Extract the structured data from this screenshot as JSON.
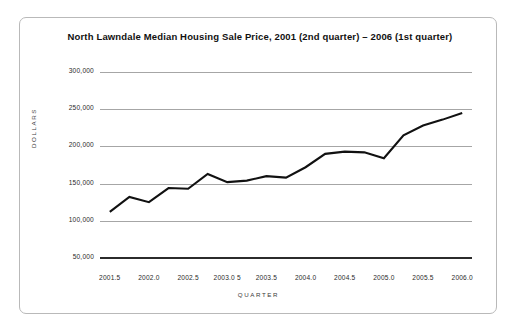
{
  "figure": {
    "title": "North Lawndale Median Housing Sale Price, 2001 (2nd quarter) – 2006 (1st quarter)",
    "frame_color": "#b9b9b9",
    "background": "#ffffff",
    "line_color": "#111111",
    "gridline_color": "#a6a6a6"
  },
  "chart_data": {
    "type": "line",
    "title": "North Lawndale Median Housing Sale Price, 2001 (2nd quarter) – 2006 (1st quarter)",
    "xlabel": "QUARTER",
    "ylabel": "DOLLARS",
    "xlim": [
      2001.375,
      2006.125
    ],
    "ylim": [
      50000,
      300000
    ],
    "grid": true,
    "legend": null,
    "ytick_labels": [
      "300,000",
      "250,000",
      "200,000",
      "150,000",
      "100,000",
      "50,000"
    ],
    "yticks": [
      300000,
      250000,
      200000,
      150000,
      100000,
      50000
    ],
    "xtick_labels": [
      "2001.5",
      "2002.0",
      "2002.5",
      "2003.0 5",
      "2003.5",
      "2004.0",
      "2004.5",
      "2005.0",
      "2005.5",
      "2006.0"
    ],
    "xticks": [
      2001.5,
      2002.0,
      2002.5,
      2003.0,
      2003.5,
      2004.0,
      2004.5,
      2005.0,
      2005.5,
      2006.0
    ],
    "x": [
      2001.5,
      2001.75,
      2002.0,
      2002.25,
      2002.5,
      2002.75,
      2003.0,
      2003.25,
      2003.5,
      2003.75,
      2004.0,
      2004.25,
      2004.5,
      2004.75,
      2005.0,
      2005.25,
      2005.5,
      2005.75,
      2006.0
    ],
    "values": [
      112000,
      132000,
      125000,
      144000,
      143000,
      163000,
      152000,
      154000,
      160000,
      158000,
      172000,
      190000,
      193000,
      192000,
      184000,
      215000,
      228000,
      236000,
      245000
    ],
    "series": [
      {
        "name": "Median Housing Sale Price",
        "values": [
          112000,
          132000,
          125000,
          144000,
          143000,
          163000,
          152000,
          154000,
          160000,
          158000,
          172000,
          190000,
          193000,
          192000,
          184000,
          215000,
          228000,
          236000,
          245000
        ]
      }
    ]
  }
}
